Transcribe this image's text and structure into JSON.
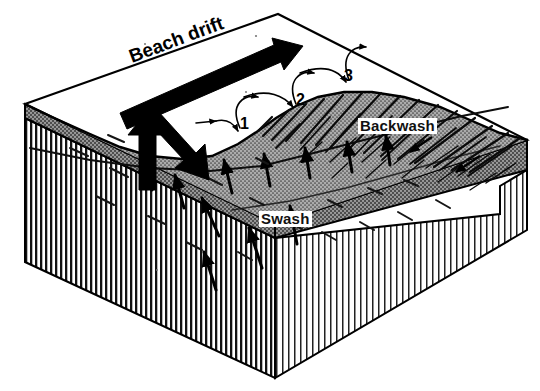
{
  "figure": {
    "type": "coastal-process-diagram",
    "background_color": "#ffffff",
    "ink_color": "#000000",
    "sand_fill_color": "#9a9a9a",
    "bedrock_fill_color": "#ffffff"
  },
  "labels": {
    "beach_drift": "Beach drift",
    "swash": "Swash",
    "backwash": "Backwash"
  },
  "step_numbers": {
    "one": "1",
    "two": "2",
    "three": "3"
  },
  "annotations": {
    "major_arrow_name": "beach-drift-direction",
    "swash_arrow_name": "swash-up-arrow",
    "backwash_arrow_name": "backwash-down-arrow",
    "zigzag_name": "sediment-zigzag-path"
  }
}
